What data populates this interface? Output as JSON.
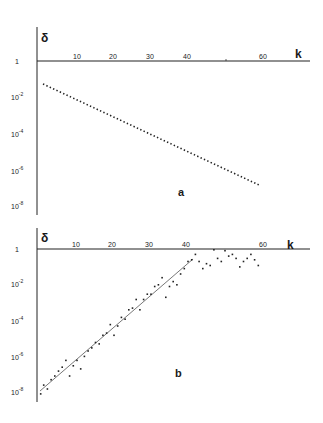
{
  "chart_data": [
    {
      "type": "scatter",
      "panel_label": "a",
      "title": "",
      "xlabel": "k",
      "ylabel": "δ",
      "yscale": "log",
      "xlim": [
        0,
        70
      ],
      "ylim": [
        1e-08,
        1
      ],
      "x_ticks": [
        10,
        20,
        30,
        40,
        50,
        60
      ],
      "x_tick_labels": [
        "10",
        "20",
        "30",
        "40",
        "",
        "60"
      ],
      "y_ticks": [
        1,
        0.01,
        0.0001,
        1e-06,
        1e-08
      ],
      "y_tick_labels": [
        "1",
        "10-2",
        "10-4",
        "10-6",
        "10-8"
      ],
      "grid": false,
      "series": [
        {
          "name": "dotted",
          "style": "dotted-line",
          "x_start": 1,
          "y_start": 0.056,
          "x_end": 59.5,
          "y_end": 2e-07
        }
      ]
    },
    {
      "type": "scatter",
      "panel_label": "b",
      "title": "",
      "xlabel": "k",
      "ylabel": "δ",
      "yscale": "log",
      "xlim": [
        0,
        70
      ],
      "ylim": [
        1e-08,
        1
      ],
      "x_ticks": [
        10,
        20,
        30,
        40,
        50,
        60
      ],
      "x_tick_labels": [
        "10",
        "20",
        "30",
        "40",
        "",
        "60"
      ],
      "y_ticks": [
        1,
        0.01,
        0.0001,
        1e-06,
        1e-08
      ],
      "y_tick_labels": [
        "1",
        "10-2",
        "10-4",
        "10-6",
        "10-8"
      ],
      "grid": false,
      "fit_line": {
        "x_start": 0.5,
        "y_start": 1e-08,
        "x_end": 41.5,
        "y_end": 0.28
      },
      "series": [
        {
          "name": "points",
          "points": [
            [
              0.2,
              8e-09
            ],
            [
              1,
              2.5e-08
            ],
            [
              2,
              1.5e-08
            ],
            [
              3,
              5e-08
            ],
            [
              4,
              8e-08
            ],
            [
              5,
              1.5e-07
            ],
            [
              6,
              2.5e-07
            ],
            [
              7,
              6e-07
            ],
            [
              8,
              8e-08
            ],
            [
              9,
              3e-07
            ],
            [
              10,
              6e-07
            ],
            [
              11,
              2e-07
            ],
            [
              12,
              1e-06
            ],
            [
              13,
              2e-06
            ],
            [
              14,
              3e-06
            ],
            [
              15,
              6e-06
            ],
            [
              16,
              5e-06
            ],
            [
              17,
              1.5e-05
            ],
            [
              18,
              2e-05
            ],
            [
              19,
              6e-05
            ],
            [
              20,
              1.5e-05
            ],
            [
              21,
              5e-05
            ],
            [
              22,
              0.00015
            ],
            [
              23,
              0.00012
            ],
            [
              24,
              0.0004
            ],
            [
              25,
              0.0005
            ],
            [
              26,
              0.0015
            ],
            [
              27,
              0.0004
            ],
            [
              28,
              0.0015
            ],
            [
              29,
              0.003
            ],
            [
              30,
              0.003
            ],
            [
              31,
              0.008
            ],
            [
              32,
              0.01
            ],
            [
              33,
              0.025
            ],
            [
              34,
              0.002
            ],
            [
              35,
              0.008
            ],
            [
              36,
              0.015
            ],
            [
              37,
              0.01
            ],
            [
              38,
              0.04
            ],
            [
              39,
              0.08
            ],
            [
              40,
              0.2
            ],
            [
              41,
              0.25
            ],
            [
              42,
              0.5
            ],
            [
              43,
              0.2
            ],
            [
              44,
              0.08
            ],
            [
              45,
              0.15
            ],
            [
              46,
              0.12
            ],
            [
              47,
              0.9
            ],
            [
              48,
              0.3
            ],
            [
              49,
              0.2
            ],
            [
              50,
              0.8
            ],
            [
              51,
              0.4
            ],
            [
              52,
              0.5
            ],
            [
              53,
              0.3
            ],
            [
              54,
              0.1
            ],
            [
              55,
              0.2
            ],
            [
              56,
              0.3
            ],
            [
              57,
              0.5
            ],
            [
              58,
              0.25
            ],
            [
              59,
              0.12
            ]
          ]
        }
      ]
    }
  ],
  "labels": {
    "panel_a": "a",
    "panel_b": "b",
    "axis_x": "k",
    "axis_y": "δ",
    "ytick_1": "1",
    "ytick_base": "10",
    "exp_2": "-2",
    "exp_4": "-4",
    "exp_6": "-6",
    "exp_8": "-8",
    "x10": "10",
    "x20": "20",
    "x30": "30",
    "x40": "40",
    "x60": "60"
  }
}
